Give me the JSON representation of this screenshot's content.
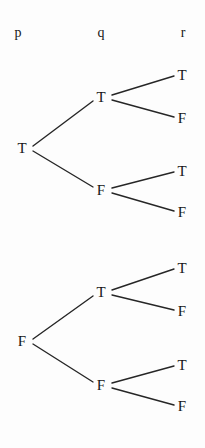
{
  "figure": {
    "type": "binary-truth-tree",
    "background_color": "#fdfdfd",
    "text_color": "#161616",
    "line_color": "#262626",
    "width": 205,
    "height": 448
  },
  "headers": [
    {
      "label": "p",
      "x": 18,
      "y": 33
    },
    {
      "label": "q",
      "x": 101,
      "y": 33
    },
    {
      "label": "r",
      "x": 183,
      "y": 33
    }
  ],
  "nodes": {
    "roots": [
      {
        "id": "root-t",
        "label": "T",
        "x": 22,
        "y": 148
      },
      {
        "id": "root-f",
        "label": "F",
        "x": 22,
        "y": 341
      }
    ],
    "level2": [
      {
        "id": "t-t",
        "label": "T",
        "x": 101,
        "y": 97
      },
      {
        "id": "t-f",
        "label": "F",
        "x": 101,
        "y": 190
      },
      {
        "id": "f-t",
        "label": "T",
        "x": 101,
        "y": 292
      },
      {
        "id": "f-f",
        "label": "F",
        "x": 101,
        "y": 385
      }
    ],
    "leaves": [
      {
        "id": "leaf-ttt",
        "label": "T",
        "x": 182,
        "y": 75
      },
      {
        "id": "leaf-ttf",
        "label": "F",
        "x": 182,
        "y": 118
      },
      {
        "id": "leaf-tft",
        "label": "T",
        "x": 182,
        "y": 171
      },
      {
        "id": "leaf-tff",
        "label": "F",
        "x": 182,
        "y": 212
      },
      {
        "id": "leaf-ftt",
        "label": "T",
        "x": 182,
        "y": 268
      },
      {
        "id": "leaf-ftf",
        "label": "F",
        "x": 182,
        "y": 311
      },
      {
        "id": "leaf-fft",
        "label": "T",
        "x": 182,
        "y": 365
      },
      {
        "id": "leaf-fff",
        "label": "F",
        "x": 182,
        "y": 406
      }
    ]
  },
  "edges": [
    {
      "id": "edge-rootT-tT",
      "x1": 33,
      "y1": 146,
      "x2": 93,
      "y2": 101
    },
    {
      "id": "edge-rootT-tF",
      "x1": 33,
      "y1": 151,
      "x2": 93,
      "y2": 187
    },
    {
      "id": "edge-rootF-fT",
      "x1": 33,
      "y1": 339,
      "x2": 93,
      "y2": 296
    },
    {
      "id": "edge-rootF-fF",
      "x1": 33,
      "y1": 344,
      "x2": 93,
      "y2": 382
    },
    {
      "id": "edge-tT-leafT",
      "x1": 112,
      "y1": 95,
      "x2": 174,
      "y2": 76
    },
    {
      "id": "edge-tT-leafF",
      "x1": 112,
      "y1": 100,
      "x2": 174,
      "y2": 117
    },
    {
      "id": "edge-tF-leafT",
      "x1": 112,
      "y1": 188,
      "x2": 174,
      "y2": 172
    },
    {
      "id": "edge-tF-leafF",
      "x1": 112,
      "y1": 193,
      "x2": 174,
      "y2": 211
    },
    {
      "id": "edge-fT-leafT",
      "x1": 112,
      "y1": 290,
      "x2": 174,
      "y2": 269
    },
    {
      "id": "edge-fT-leafF",
      "x1": 112,
      "y1": 295,
      "x2": 174,
      "y2": 310
    },
    {
      "id": "edge-fF-leafT",
      "x1": 112,
      "y1": 383,
      "x2": 174,
      "y2": 366
    },
    {
      "id": "edge-fF-leafF",
      "x1": 112,
      "y1": 388,
      "x2": 174,
      "y2": 405
    }
  ]
}
